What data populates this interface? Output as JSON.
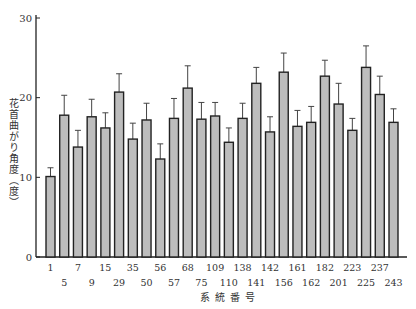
{
  "chart_data": {
    "type": "bar",
    "title": "",
    "xlabel": "系統番号",
    "ylabel": "花首曲がり角度（度）",
    "ylim": [
      0,
      30
    ],
    "yticks": [
      0,
      10,
      20,
      30
    ],
    "grid": false,
    "legend": null,
    "error_bars": true,
    "categories": [
      "1",
      "5",
      "7",
      "9",
      "15",
      "29",
      "35",
      "50",
      "56",
      "57",
      "68",
      "75",
      "109",
      "110",
      "138",
      "141",
      "142",
      "156",
      "161",
      "162",
      "182",
      "201",
      "223",
      "225",
      "237",
      "243"
    ],
    "values": [
      10.1,
      17.8,
      13.8,
      17.6,
      16.2,
      20.7,
      14.8,
      17.2,
      12.3,
      17.4,
      21.2,
      17.3,
      17.7,
      14.4,
      17.4,
      21.8,
      15.7,
      23.2,
      16.4,
      16.9,
      22.7,
      19.2,
      15.9,
      23.8,
      20.4,
      16.9
    ],
    "error_upper": [
      11.2,
      20.3,
      15.9,
      19.8,
      18.1,
      23.0,
      16.8,
      19.3,
      14.2,
      19.9,
      24.0,
      19.4,
      19.4,
      16.2,
      19.3,
      23.8,
      17.6,
      25.6,
      18.4,
      18.9,
      24.7,
      21.8,
      17.4,
      26.5,
      22.7,
      18.6
    ]
  },
  "axis": {
    "ylabel": "花首曲がり角度（度）",
    "xtitle": "系統番号"
  }
}
